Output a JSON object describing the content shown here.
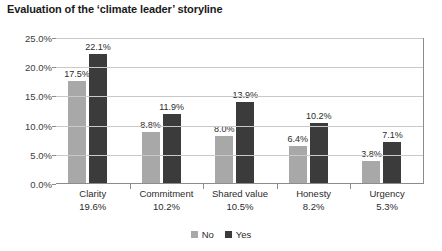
{
  "chart_data": {
    "type": "bar",
    "title": "Evaluation of the ‘climate leader’ storyline",
    "xlabel": "",
    "ylabel": "",
    "ylim": [
      0,
      25
    ],
    "ytick_labels": [
      "0.0%",
      "5.0%",
      "10.0%",
      "15.0%",
      "20.0%",
      "25.0%"
    ],
    "ytick_values": [
      0,
      5,
      10,
      15,
      20,
      25
    ],
    "grid": true,
    "legend_position": "bottom",
    "categories": [
      "Clarity",
      "Commitment",
      "Shared value",
      "Honesty",
      "Urgency"
    ],
    "category_sublabels": [
      "19.6%",
      "10.2%",
      "10.5%",
      "8.2%",
      "5.3%"
    ],
    "series": [
      {
        "name": "No",
        "color": "#a8a8a8",
        "values": [
          17.5,
          8.8,
          8.0,
          6.4,
          3.8
        ],
        "labels": [
          "17.5%",
          "8.8%",
          "8.0%",
          "6.4%",
          "3.8%"
        ]
      },
      {
        "name": "Yes",
        "color": "#3b3b3b",
        "values": [
          22.1,
          11.9,
          13.9,
          10.2,
          7.1
        ],
        "labels": [
          "22.1%",
          "11.9%",
          "13.9%",
          "10.2%",
          "7.1%"
        ]
      }
    ]
  }
}
